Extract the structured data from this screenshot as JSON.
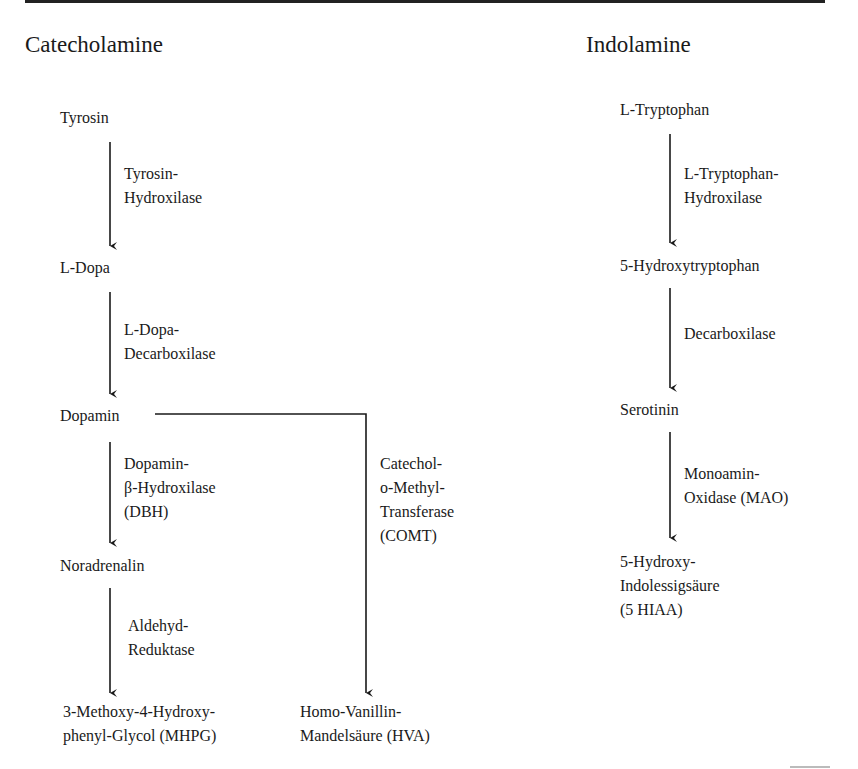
{
  "catecholamine": {
    "title": "Catecholamine",
    "nodes": [
      "Tyrosin",
      "L-Dopa",
      "Dopamin",
      "Noradrenalin",
      "3-Methoxy-4-Hydroxy-\nphenyl-Glycol (MHPG)"
    ],
    "enzymes": [
      "Tyrosin-\nHydroxilase",
      "L-Dopa-\nDecarboxilase",
      "Dopamin-\nβ-Hydroxilase\n(DBH)",
      "Aldehyd-\nReduktase"
    ],
    "branch": {
      "enzyme": "Catechol-\no-Methyl-\nTransferase\n(COMT)",
      "product": "Homo-Vanillin-\nMandelsäure (HVA)"
    }
  },
  "indolamine": {
    "title": "Indolamine",
    "nodes": [
      "L-Tryptophan",
      "5-Hydroxytryptophan",
      "Serotinin",
      "5-Hydroxy-\nIndolessigsäure\n(5 HIAA)"
    ],
    "enzymes": [
      "L-Tryptophan-\nHydroxilase",
      "Decarboxilase",
      "Monoamin-\nOxidase (MAO)"
    ]
  },
  "colors": {
    "ink": "#1a1a1a",
    "background": "#ffffff"
  }
}
